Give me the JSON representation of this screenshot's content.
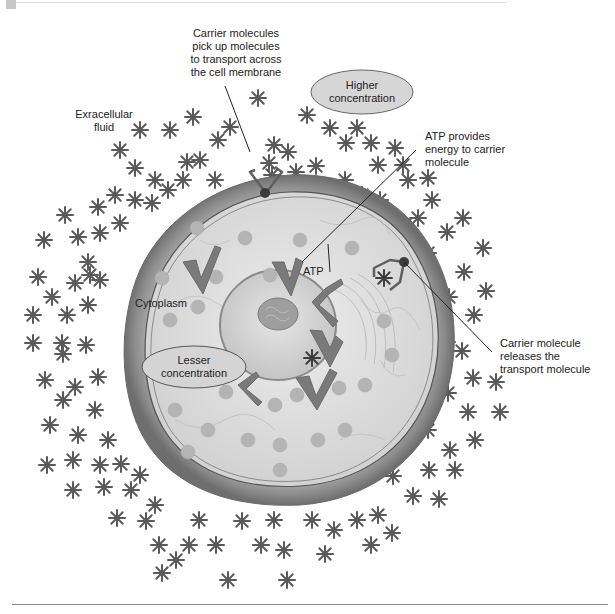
{
  "figure": {
    "type": "cell-membrane-active-transport-diagram",
    "colors": {
      "star": "#5a5a5a",
      "membrane_outer": "#8c8c8c",
      "cytoplasm": "#dcdcdc",
      "oval_fill": "#d4d4d4",
      "carrier": "#6b6b6b",
      "carrier_head": "#3a3a3a",
      "vesicle": "#b8b8b8",
      "chevron": "#7a7a7a",
      "line": "#222222"
    }
  },
  "labels": {
    "carrier_pickup": [
      "Carrier molecules",
      "pick up molecules",
      "to transport across",
      "the cell membrane"
    ],
    "extracellular": [
      "Exracellular",
      "fluid"
    ],
    "higher_concentration": [
      "Higher",
      "concentration"
    ],
    "atp_provides": [
      "ATP provides",
      "energy to carrier",
      "molecule"
    ],
    "atp": "ATP",
    "cytoplasm": "Cytoplasm",
    "lesser_concentration": [
      "Lesser",
      "concentration"
    ],
    "carrier_release": [
      "Carrier molecule",
      "releases the",
      "transport molecule"
    ]
  }
}
